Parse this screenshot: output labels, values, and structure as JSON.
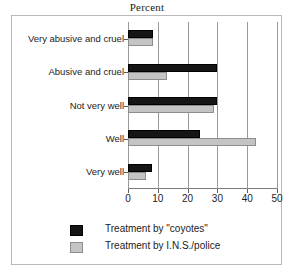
{
  "chart_data": {
    "type": "bar",
    "orientation": "horizontal",
    "title": "Percent",
    "xlabel": "",
    "ylabel": "",
    "xlim": [
      0,
      50
    ],
    "xticks": [
      0,
      10,
      20,
      30,
      40,
      50
    ],
    "grid": true,
    "grid_axis": "x",
    "legend_position": "bottom",
    "categories": [
      "Very abusive and cruel",
      "Abusive and cruel",
      "Not very well",
      "Well",
      "Very well"
    ],
    "series": [
      {
        "name": "Treatment by \"coyotes\"",
        "color": "#151515",
        "values": [
          8.5,
          30,
          30,
          24,
          8
        ]
      },
      {
        "name": "Treatment by I.N.S./police",
        "color": "#c4c4c4",
        "values": [
          8.5,
          13,
          29,
          43,
          6
        ]
      }
    ]
  },
  "legend": {
    "items": [
      {
        "label": "Treatment by \"coyotes\"",
        "swatch": "black"
      },
      {
        "label": "Treatment by I.N.S./police",
        "swatch": "gray"
      }
    ]
  }
}
